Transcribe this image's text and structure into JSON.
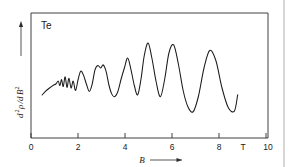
{
  "figure": {
    "sample_label": "Te",
    "x_axis": {
      "title": "B",
      "unit": "T",
      "tick_labels": [
        "0",
        "2",
        "4",
        "6",
        "8",
        "10"
      ],
      "tick_values": [
        0,
        2,
        4,
        6,
        8,
        10
      ],
      "range": [
        0,
        10
      ],
      "arrow": "right-arrow-icon"
    },
    "y_axis": {
      "title_main": "d",
      "title_sup1": "2",
      "title_rho": "ρ",
      "title_div": "/d",
      "title_b": "B",
      "title_sup2": "2",
      "title_full": "d²ρ/dB²",
      "arrow": "up-arrow-icon"
    },
    "colors": {
      "curve": "#1a1a1a",
      "frame": "#2b2b2b",
      "background": "#ffffff",
      "page_edge": "#9a9a9a"
    }
  },
  "chart_data": {
    "type": "line",
    "title": "",
    "subtitle": "",
    "xlabel": "B",
    "ylabel": "d²ρ/dB²",
    "xunit": "T",
    "yunit": "",
    "xlim": [
      0,
      10
    ],
    "ylim": [
      0,
      1
    ],
    "grid": false,
    "legend": null,
    "annotations": [
      {
        "text": "Te",
        "x": 0.55,
        "y": 0.93,
        "note": "sample material label, upper-left inside frame"
      }
    ],
    "xticks": [
      0,
      2,
      4,
      6,
      8,
      10
    ],
    "xticklabels": [
      "0",
      "2",
      "4",
      "6",
      "8",
      "10"
    ],
    "yticks": [],
    "yticklabels": [],
    "series": [
      {
        "name": "d2rho/dB2 vs B",
        "description": "Shubnikov-de Haas oscillations in Tellurium; amplitude and period both increase with magnetic field",
        "x": [
          0.47,
          0.62,
          0.78,
          0.93,
          1.05,
          1.15,
          1.22,
          1.29,
          1.36,
          1.44,
          1.52,
          1.6,
          1.69,
          1.78,
          1.88,
          1.99,
          2.1,
          2.22,
          2.34,
          2.46,
          2.58,
          2.7,
          2.82,
          2.94,
          3.03,
          3.1,
          3.18,
          3.28,
          3.4,
          3.52,
          3.66,
          3.8,
          3.94,
          4.08,
          4.22,
          4.36,
          4.5,
          4.64,
          4.78,
          4.94,
          5.1,
          5.28,
          5.46,
          5.64,
          5.82,
          6.02,
          6.22,
          6.42,
          6.62,
          6.84,
          7.06,
          7.3,
          7.54,
          7.8,
          8.06,
          8.32,
          8.58,
          8.72
        ],
        "y": [
          0.345,
          0.375,
          0.4,
          0.42,
          0.432,
          0.455,
          0.42,
          0.468,
          0.412,
          0.49,
          0.405,
          0.478,
          0.4,
          0.455,
          0.38,
          0.47,
          0.535,
          0.5,
          0.43,
          0.372,
          0.43,
          0.545,
          0.58,
          0.56,
          0.585,
          0.57,
          0.525,
          0.43,
          0.355,
          0.33,
          0.37,
          0.47,
          0.56,
          0.64,
          0.545,
          0.42,
          0.345,
          0.47,
          0.66,
          0.76,
          0.64,
          0.45,
          0.33,
          0.47,
          0.68,
          0.745,
          0.59,
          0.38,
          0.25,
          0.21,
          0.33,
          0.56,
          0.7,
          0.62,
          0.4,
          0.245,
          0.215,
          0.345
        ],
        "y_note": "y values normalized 0-1 within plot frame; axis is unlabeled (arbitrary units)"
      }
    ]
  }
}
